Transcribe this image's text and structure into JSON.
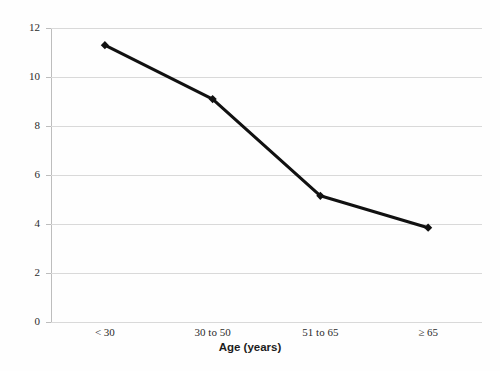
{
  "chart_data": {
    "type": "line",
    "title": "",
    "xlabel": "Age (years)",
    "ylabel": "% of patients with positive skin test",
    "categories": [
      "< 30",
      "30 to 50",
      "51 to 65",
      "≥ 65"
    ],
    "values": [
      11.3,
      9.1,
      5.15,
      3.85
    ],
    "series": [
      {
        "name": "% of patients with positive skin test",
        "values": [
          11.3,
          9.1,
          5.15,
          3.85
        ]
      }
    ],
    "ylim": [
      0,
      12
    ],
    "ytick_labels": [
      "0",
      "2",
      "4",
      "6",
      "8",
      "10",
      "12"
    ],
    "ytick_values": [
      0,
      2,
      4,
      6,
      8,
      10,
      12
    ],
    "grid": "horizontal",
    "legend": "none",
    "line_color": "#111111",
    "marker": "diamond",
    "gridline_color": "#d9d9d9",
    "background_color": "#fefefe"
  },
  "axes": {
    "y_title": "% of patients with positive skin test",
    "x_title": "Age (years)"
  },
  "scan_artifacts": {
    "top_strip": "",
    "bottom_strip": ""
  }
}
